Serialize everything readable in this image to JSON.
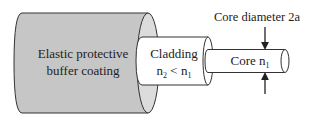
{
  "diagram": {
    "layers": [
      {
        "id": "buffer",
        "label_line1": "Elastic protective",
        "label_line2": "buffer coating",
        "fill": "#c9c9c9"
      },
      {
        "id": "cladding",
        "label_line1": "Cladding",
        "label_line2_base": "n",
        "label_line2_sub1": "2",
        "label_line2_op": " < n",
        "label_line2_sub2": "1",
        "fill": "#ffffff"
      },
      {
        "id": "core",
        "label_base": "Core n",
        "label_sub": "1",
        "fill": "#ffffff"
      }
    ],
    "annotation": {
      "text": "Core diameter 2a"
    },
    "colors": {
      "stroke": "#333333",
      "buffer_fill": "#c9c9c9",
      "buffer_end_fill": "#dedede",
      "background": "#ffffff"
    }
  }
}
